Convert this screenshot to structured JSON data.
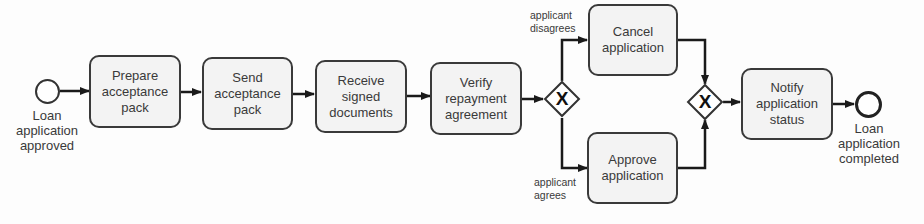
{
  "diagram": {
    "type": "BPMN process",
    "start_event": {
      "label_lines": [
        "Loan",
        "application",
        "approved"
      ]
    },
    "tasks": [
      {
        "id": "t1",
        "label": "Prepare acceptance pack"
      },
      {
        "id": "t2",
        "label": "Send acceptance pack"
      },
      {
        "id": "t3",
        "label": "Receive signed documents"
      },
      {
        "id": "t4",
        "label": "Verify repayment agreement"
      },
      {
        "id": "t5",
        "label": "Cancel application"
      },
      {
        "id": "t6",
        "label": "Approve application"
      },
      {
        "id": "t7",
        "label": "Notify application status"
      }
    ],
    "gateways": [
      {
        "id": "g1",
        "type": "exclusive-split",
        "symbol": "X"
      },
      {
        "id": "g2",
        "type": "exclusive-merge",
        "symbol": "X"
      }
    ],
    "flow_labels": {
      "disagrees": [
        "applicant",
        "disagrees"
      ],
      "agrees": [
        "applicant",
        "agrees"
      ]
    },
    "end_event": {
      "label_lines": [
        "Loan",
        "application",
        "completed"
      ]
    },
    "flows": [
      [
        "start",
        "t1"
      ],
      [
        "t1",
        "t2"
      ],
      [
        "t2",
        "t3"
      ],
      [
        "t3",
        "t4"
      ],
      [
        "t4",
        "g1"
      ],
      [
        "g1",
        "t5",
        "applicant disagrees"
      ],
      [
        "g1",
        "t6",
        "applicant agrees"
      ],
      [
        "t5",
        "g2"
      ],
      [
        "t6",
        "g2"
      ],
      [
        "g2",
        "t7"
      ],
      [
        "t7",
        "end"
      ]
    ]
  }
}
